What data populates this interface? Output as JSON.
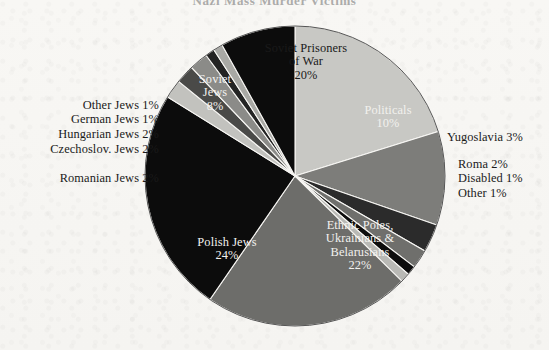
{
  "title": "Nazi Mass Murder Victims",
  "background_color": "#f7f6f3",
  "chart_data": {
    "type": "pie",
    "title": "Nazi Mass Murder Victims",
    "units": "percent",
    "legend": "labels on slices and outside pie",
    "total": 100,
    "start_angle_deg": 0,
    "direction": "clockwise",
    "categories": [
      "Soviet Prisoners of War",
      "Politicals",
      "Yugoslavia",
      "Roma",
      "Disabled",
      "Other",
      "Ethnic Poles, Ukrainians & Belarusians",
      "Polish Jews",
      "Romanian Jews",
      "Czechoslov. Jews",
      "Hungarian Jews",
      "German Jews",
      "Other Jews",
      "Soviet Jews"
    ],
    "values": [
      20,
      10,
      3,
      2,
      1,
      1,
      22,
      24,
      2,
      2,
      2,
      1,
      1,
      8
    ],
    "colors": [
      "#c8c8c4",
      "#7d7d7a",
      "#2b2b2b",
      "#6f6f6c",
      "#0d0d0d",
      "#b9b9b5",
      "#6d6d6a",
      "#0c0c0c",
      "#c2c2be",
      "#4a4a48",
      "#8b8b88",
      "#232323",
      "#a9a9a5",
      "#0c0c0c"
    ],
    "slices": [
      {
        "label": "Soviet Prisoners of War",
        "value": 20,
        "display": "20%",
        "color": "#c8c8c4",
        "label_placement": "inside",
        "text_color": "dark"
      },
      {
        "label": "Politicals",
        "value": 10,
        "display": "10%",
        "color": "#7d7d7a",
        "label_placement": "inside",
        "text_color": "light"
      },
      {
        "label": "Yugoslavia",
        "value": 3,
        "display": "3%",
        "color": "#2b2b2b",
        "label_placement": "outside-right",
        "text_color": "dark"
      },
      {
        "label": "Roma",
        "value": 2,
        "display": "2%",
        "color": "#6f6f6c",
        "label_placement": "outside-right",
        "text_color": "dark"
      },
      {
        "label": "Disabled",
        "value": 1,
        "display": "1%",
        "color": "#0d0d0d",
        "label_placement": "outside-right",
        "text_color": "dark"
      },
      {
        "label": "Other",
        "value": 1,
        "display": "1%",
        "color": "#b9b9b5",
        "label_placement": "outside-right",
        "text_color": "dark"
      },
      {
        "label": "Ethnic Poles, Ukrainians & Belarusians",
        "value": 22,
        "display": "22%",
        "color": "#6d6d6a",
        "label_placement": "inside",
        "text_color": "light"
      },
      {
        "label": "Polish Jews",
        "value": 24,
        "display": "24%",
        "color": "#0c0c0c",
        "label_placement": "inside",
        "text_color": "light"
      },
      {
        "label": "Romanian Jews",
        "value": 2,
        "display": "2%",
        "color": "#c2c2be",
        "label_placement": "outside-left",
        "text_color": "dark"
      },
      {
        "label": "Czechoslov. Jews",
        "value": 2,
        "display": "2%",
        "color": "#4a4a48",
        "label_placement": "outside-left",
        "text_color": "dark"
      },
      {
        "label": "Hungarian Jews",
        "value": 2,
        "display": "2%",
        "color": "#8b8b88",
        "label_placement": "outside-left",
        "text_color": "dark"
      },
      {
        "label": "German Jews",
        "value": 1,
        "display": "1%",
        "color": "#232323",
        "label_placement": "outside-left",
        "text_color": "dark"
      },
      {
        "label": "Other Jews",
        "value": 1,
        "display": "1%",
        "color": "#a9a9a5",
        "label_placement": "outside-left",
        "text_color": "dark"
      },
      {
        "label": "Soviet Jews",
        "value": 8,
        "display": "8%",
        "color": "#0c0c0c",
        "label_placement": "inside",
        "text_color": "light"
      }
    ]
  },
  "labels": {
    "soviet_pow_l1": "Soviet Prisoners",
    "soviet_pow_l2": "of War",
    "soviet_pow_pct": "20%",
    "politicals_l1": "Politicals",
    "politicals_pct": "10%",
    "soviet_jews_l1": "Soviet",
    "soviet_jews_l2": "Jews",
    "soviet_jews_pct": "8%",
    "polish_jews_l1": "Polish Jews",
    "polish_jews_pct": "24%",
    "ethnic_l1": "Ethnic Poles,",
    "ethnic_l2": "Ukrainians &",
    "ethnic_l3": "Belarusians",
    "ethnic_pct": "22%",
    "other_jews": "Other Jews 1%",
    "german_jews": "German Jews 1%",
    "hungarian_jews": "Hungarian Jews 2%",
    "czechoslov_jews": "Czechoslov. Jews 2%",
    "romanian_jews": "Romanian Jews 2%",
    "yugoslavia": "Yugoslavia 3%",
    "roma": "Roma 2%",
    "disabled": "Disabled 1%",
    "other": "Other 1%"
  }
}
